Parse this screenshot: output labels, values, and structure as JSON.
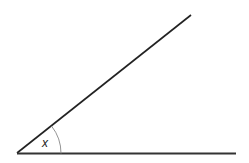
{
  "diagram": {
    "type": "angle",
    "angle_label": "x",
    "vertex": [
      17,
      153
    ],
    "ray_upper_end": [
      191,
      15
    ],
    "ray_lower_end": [
      236,
      154
    ],
    "arc_radius": 44,
    "colors": {
      "background": "#ffffff",
      "line": "#222222",
      "arc": "#888888"
    }
  }
}
